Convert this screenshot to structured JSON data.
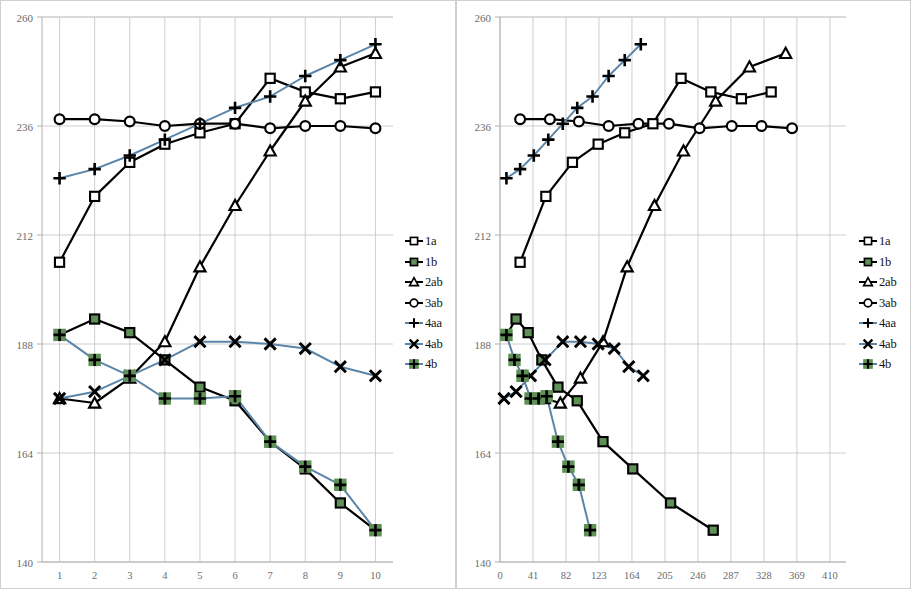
{
  "figure": {
    "panel_count": 2,
    "background": "#ffffff",
    "border_color": "#cfcfcf"
  },
  "legend": {
    "position": "right",
    "entries": [
      {
        "label": "1a",
        "marker": "square",
        "color": "#000000",
        "fill": "#ffffff",
        "line": "#000000"
      },
      {
        "label": "1b",
        "marker": "square",
        "color": "#000000",
        "fill": "#5f9055",
        "line": "#000000"
      },
      {
        "label": "2ab",
        "marker": "triangle",
        "color": "#000000",
        "fill": "#ffffff",
        "line": "#000000"
      },
      {
        "label": "3ab",
        "marker": "circle",
        "color": "#000000",
        "fill": "#ffffff",
        "line": "#000000"
      },
      {
        "label": "4aa",
        "marker": "plus",
        "color": "#000000",
        "fill": "none",
        "line": "#5b85a8"
      },
      {
        "label": "4ab",
        "marker": "cross",
        "color": "#000000",
        "fill": "none",
        "line": "#5b85a8"
      },
      {
        "label": "4b",
        "marker": "plus-on-green",
        "color": "#000000",
        "fill": "#5f9055",
        "line": "#5b85a8"
      }
    ]
  },
  "chart_data": [
    {
      "id": "left",
      "type": "line",
      "title": "",
      "xlabel": "",
      "ylabel": "",
      "xlim": [
        0.5,
        10.5
      ],
      "ylim": [
        140,
        260
      ],
      "yticks": [
        140,
        164,
        188,
        212,
        236,
        260
      ],
      "xticks": [
        1,
        2,
        3,
        4,
        5,
        6,
        7,
        8,
        9,
        10
      ],
      "x": [
        1,
        2,
        3,
        4,
        5,
        6,
        7,
        8,
        9,
        10
      ],
      "grid": true,
      "series": [
        {
          "name": "1a",
          "marker": "square",
          "line_color": "#000000",
          "marker_fill": "#ffffff",
          "values": [
            206.0,
            220.5,
            228.0,
            232.0,
            234.5,
            236.5,
            246.5,
            243.5,
            242.0,
            243.5
          ]
        },
        {
          "name": "1b",
          "marker": "square",
          "line_color": "#000000",
          "marker_fill": "#5f9055",
          "values": [
            190.0,
            193.5,
            190.5,
            184.5,
            178.5,
            175.5,
            166.5,
            160.5,
            153.0,
            147.0
          ]
        },
        {
          "name": "2ab",
          "marker": "triangle",
          "line_color": "#000000",
          "marker_fill": "#ffffff",
          "values": [
            176.0,
            175.0,
            180.5,
            188.5,
            205.0,
            218.5,
            230.5,
            241.5,
            249.0,
            252.0
          ]
        },
        {
          "name": "3ab",
          "marker": "circle",
          "line_color": "#000000",
          "marker_fill": "#ffffff",
          "values": [
            237.5,
            237.5,
            237.0,
            236.0,
            236.5,
            236.5,
            235.5,
            236.0,
            236.0,
            235.5
          ]
        },
        {
          "name": "4aa",
          "marker": "plus",
          "line_color": "#5b85a8",
          "marker_fill": "none",
          "values": [
            224.5,
            226.5,
            229.5,
            233.0,
            236.5,
            240.0,
            242.5,
            247.0,
            250.5,
            254.0
          ]
        },
        {
          "name": "4ab",
          "marker": "cross",
          "line_color": "#5b85a8",
          "marker_fill": "none",
          "values": [
            176.0,
            177.5,
            181.0,
            184.5,
            188.5,
            188.5,
            188.0,
            187.0,
            183.0,
            181.0
          ]
        },
        {
          "name": "4b",
          "marker": "plus-on-green",
          "line_color": "#5b85a8",
          "marker_fill": "#5f9055",
          "values": [
            190.0,
            184.5,
            181.0,
            176.0,
            176.0,
            176.5,
            166.5,
            161.0,
            157.0,
            147.0
          ]
        }
      ]
    },
    {
      "id": "right",
      "type": "line",
      "title": "",
      "xlabel": "",
      "ylabel": "",
      "xlim": [
        0,
        430
      ],
      "ylim": [
        140,
        260
      ],
      "yticks": [
        140,
        164,
        188,
        212,
        236,
        260
      ],
      "xticks": [
        0,
        41,
        82,
        123,
        164,
        205,
        246,
        287,
        328,
        369,
        410
      ],
      "grid": true,
      "series": [
        {
          "name": "1a",
          "marker": "square",
          "line_color": "#000000",
          "marker_fill": "#ffffff",
          "x": [
            25,
            57,
            90,
            122,
            155,
            190,
            225,
            262,
            300,
            337
          ],
          "values": [
            206.0,
            220.5,
            228.0,
            232.0,
            234.5,
            236.5,
            246.5,
            243.5,
            242.0,
            243.5
          ]
        },
        {
          "name": "1b",
          "marker": "square",
          "line_color": "#000000",
          "marker_fill": "#5f9055",
          "x": [
            8,
            20,
            35,
            52,
            72,
            96,
            128,
            165,
            212,
            265
          ],
          "values": [
            190.0,
            193.5,
            190.5,
            184.5,
            178.5,
            175.5,
            166.5,
            160.5,
            153.0,
            147.0
          ]
        },
        {
          "name": "2ab",
          "marker": "triangle",
          "line_color": "#000000",
          "marker_fill": "#ffffff",
          "x": [
            55,
            75,
            100,
            128,
            158,
            192,
            228,
            268,
            310,
            355
          ],
          "values": [
            176.0,
            175.0,
            180.5,
            188.5,
            205.0,
            218.5,
            230.5,
            241.5,
            249.0,
            252.0
          ]
        },
        {
          "name": "3ab",
          "marker": "circle",
          "line_color": "#000000",
          "marker_fill": "#ffffff",
          "x": [
            25,
            62,
            98,
            135,
            172,
            210,
            248,
            288,
            325,
            363
          ],
          "values": [
            237.5,
            237.5,
            237.0,
            236.0,
            236.5,
            236.5,
            235.5,
            236.0,
            236.0,
            235.5
          ]
        },
        {
          "name": "4aa",
          "marker": "plus",
          "line_color": "#5b85a8",
          "marker_fill": "none",
          "x": [
            8,
            25,
            42,
            60,
            78,
            96,
            115,
            135,
            155,
            175
          ],
          "values": [
            224.5,
            226.5,
            229.5,
            233.0,
            236.5,
            240.0,
            242.5,
            247.0,
            250.5,
            254.0
          ]
        },
        {
          "name": "4ab",
          "marker": "cross",
          "line_color": "#5b85a8",
          "marker_fill": "none",
          "x": [
            5,
            20,
            38,
            56,
            78,
            100,
            122,
            142,
            160,
            178
          ],
          "values": [
            176.0,
            177.5,
            181.0,
            184.5,
            188.5,
            188.5,
            188.0,
            187.0,
            183.0,
            181.0
          ]
        },
        {
          "name": "4b",
          "marker": "plus-on-green",
          "line_color": "#5b85a8",
          "marker_fill": "#5f9055",
          "x": [
            8,
            18,
            28,
            38,
            48,
            58,
            72,
            85,
            98,
            112
          ],
          "values": [
            190.0,
            184.5,
            181.0,
            176.0,
            176.0,
            176.5,
            166.5,
            161.0,
            157.0,
            147.0
          ]
        }
      ]
    }
  ],
  "axes": {
    "tick_label_color": "#6b6b6b",
    "grid_color": "#c8c8c8",
    "axis_line_color": "#b0b0b0"
  }
}
